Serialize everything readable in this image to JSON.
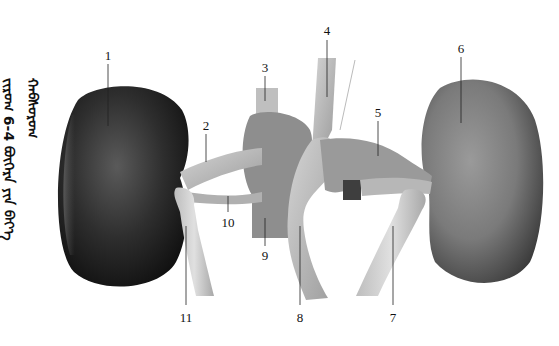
{
  "figure": {
    "caption_vertical": "ᠵᠢᠷᠤᠭ 6-4 ᠪᠥᠭᠡᠷᠡ ᠶᠢᠨ ᠪᠡᠶ᠎ᠡ ᠬᠠᠪᠰᠤᠷᠤᠭ",
    "caption_number": "6-4",
    "background_color": "#ffffff",
    "labels": [
      {
        "id": "1",
        "text": "1",
        "x": 108,
        "y": 60
      },
      {
        "id": "2",
        "text": "2",
        "x": 206,
        "y": 130
      },
      {
        "id": "3",
        "text": "3",
        "x": 265,
        "y": 72
      },
      {
        "id": "4",
        "text": "4",
        "x": 327,
        "y": 35
      },
      {
        "id": "5",
        "text": "5",
        "x": 378,
        "y": 117
      },
      {
        "id": "6",
        "text": "6",
        "x": 461,
        "y": 53
      },
      {
        "id": "7",
        "text": "7",
        "x": 393,
        "y": 322
      },
      {
        "id": "8",
        "text": "8",
        "x": 300,
        "y": 322
      },
      {
        "id": "9",
        "text": "9",
        "x": 265,
        "y": 264
      },
      {
        "id": "10",
        "text": "10",
        "x": 228,
        "y": 227
      },
      {
        "id": "11",
        "text": "11",
        "x": 186,
        "y": 322
      }
    ]
  }
}
